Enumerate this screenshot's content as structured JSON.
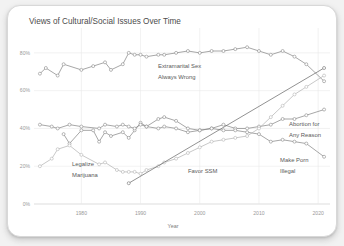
{
  "card": {
    "title": "Views of Cultural/Social Issues Over Time"
  },
  "chart_data": {
    "type": "line",
    "title": "Views of Cultural/Social Issues Over Time",
    "xlabel": "Year",
    "ylabel": "",
    "xlim": [
      1972,
      2022
    ],
    "ylim": [
      0,
      90
    ],
    "grid": true,
    "legend_position": "inline-annotations",
    "xticks": [
      1980,
      1990,
      2000,
      2010,
      2020
    ],
    "xticklabels": [
      "1980",
      "1990",
      "2000",
      "2010",
      "2020"
    ],
    "yticks": [
      0,
      20,
      40,
      60,
      80
    ],
    "yticklabels": [
      "0%",
      "20%",
      "40%",
      "60%",
      "80%"
    ],
    "series": [
      {
        "name": "Extramarital Sex Always Wrong",
        "label": "Extramarital Sex",
        "label2": "Always Wrong",
        "color": "#8a8a8a",
        "marker": "circle",
        "x": [
          1973,
          1974,
          1976,
          1977,
          1980,
          1982,
          1984,
          1985,
          1987,
          1988,
          1989,
          1990,
          1991,
          1993,
          1994,
          1996,
          1998,
          2000,
          2002,
          2004,
          2006,
          2008,
          2010,
          2012,
          2014,
          2016,
          2018,
          2021
        ],
        "values": [
          69,
          72,
          68,
          74,
          71,
          73,
          75,
          71,
          74,
          80,
          79,
          79,
          78,
          79,
          79,
          80,
          81,
          80,
          81,
          81,
          82,
          83,
          81,
          79,
          81,
          78,
          74,
          65
        ]
      },
      {
        "name": "Abortion for Any Reason",
        "label": "Abortion for",
        "label2": "Any Reason",
        "color": "#8a8a8a",
        "marker": "circle",
        "x": [
          1977,
          1978,
          1980,
          1982,
          1983,
          1984,
          1985,
          1987,
          1988,
          1989,
          1990,
          1991,
          1993,
          1994,
          1996,
          1998,
          2000,
          2002,
          2004,
          2006,
          2008,
          2010,
          2012,
          2014,
          2016,
          2018,
          2021
        ],
        "values": [
          37,
          32,
          39,
          39,
          33,
          38,
          36,
          38,
          35,
          39,
          43,
          41,
          45,
          46,
          44,
          40,
          39,
          40,
          42,
          40,
          40,
          41,
          42,
          45,
          45,
          47,
          50
        ]
      },
      {
        "name": "Make Porn Illegal",
        "label": "Make Porn",
        "label2": "Illegal",
        "color": "#8a8a8a",
        "marker": "circle",
        "x": [
          1973,
          1975,
          1976,
          1978,
          1980,
          1983,
          1984,
          1986,
          1987,
          1988,
          1989,
          1990,
          1991,
          1993,
          1994,
          1996,
          1998,
          2000,
          2002,
          2004,
          2006,
          2008,
          2010,
          2012,
          2014,
          2016,
          2018,
          2021
        ],
        "values": [
          42,
          41,
          40,
          42,
          41,
          40,
          42,
          41,
          42,
          41,
          40,
          42,
          41,
          40,
          41,
          40,
          38,
          39,
          40,
          39,
          39,
          38,
          37,
          33,
          34,
          33,
          32,
          25
        ]
      },
      {
        "name": "Legalize Marijuana",
        "label": "Legalize",
        "label2": "Marijuana",
        "color": "#b5b5b5",
        "marker": "circle",
        "x": [
          1973,
          1975,
          1976,
          1978,
          1980,
          1983,
          1984,
          1986,
          1987,
          1988,
          1989,
          1990,
          1991,
          1993,
          1994,
          1996,
          1998,
          2000,
          2002,
          2004,
          2006,
          2008,
          2010,
          2012,
          2014,
          2016,
          2018,
          2021
        ],
        "values": [
          20,
          24,
          29,
          31,
          26,
          21,
          22,
          18,
          17,
          17,
          17,
          16,
          18,
          20,
          22,
          24,
          27,
          30,
          33,
          34,
          35,
          36,
          40,
          46,
          52,
          58,
          62,
          68
        ]
      },
      {
        "name": "Favor SSM",
        "label": "Favor SSM",
        "label2": "",
        "color": "#6e6e6e",
        "marker": "circle",
        "x": [
          1988,
          2021
        ],
        "values": [
          11,
          72
        ]
      }
    ]
  }
}
